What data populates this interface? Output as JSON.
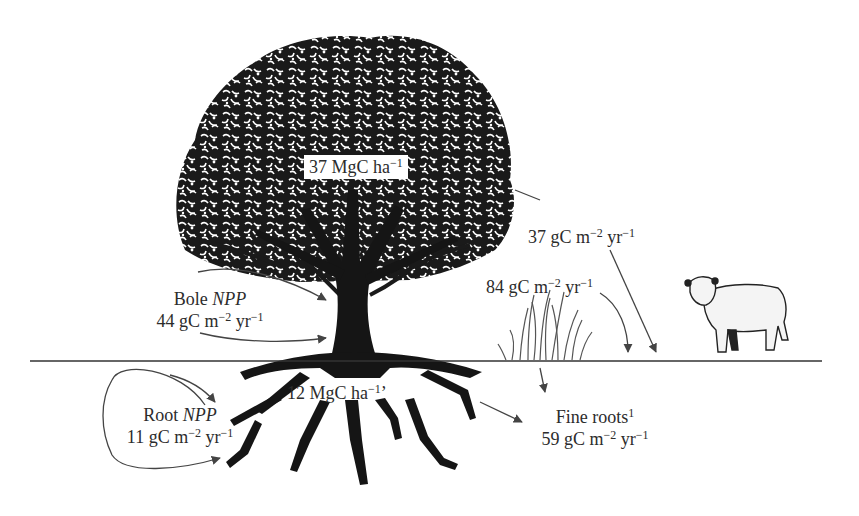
{
  "diagram": {
    "type": "carbon-flux-illustration",
    "colors": {
      "ink": "#1a1a1a",
      "text": "#2c2c2c",
      "arrow": "#555555",
      "background": "#ffffff"
    },
    "labels": {
      "canopy_stock": {
        "value": "37 MgC ha",
        "exp": "−1"
      },
      "litterfall": {
        "value": "37 gC m",
        "exp1": "−2",
        "unit2": " yr",
        "exp2": "−1"
      },
      "grass_flux": {
        "value": "84 gC m",
        "exp1": "−2",
        "unit2": " yr",
        "exp2": "−1"
      },
      "bole_npp": {
        "title": "Bole ",
        "title_italic": "NPP",
        "value": "44 gC m",
        "exp1": "−2",
        "unit2": " yr",
        "exp2": "−1"
      },
      "root_stock": {
        "value": "12 MgC ha",
        "exp": "−1",
        "mark": "’"
      },
      "root_npp": {
        "title": "Root ",
        "title_italic": "NPP",
        "value": "11 gC m",
        "exp1": "−2",
        "unit2": " yr",
        "exp2": "−1"
      },
      "fine_roots": {
        "title": "Fine roots",
        "title_sup": "1",
        "value": "59 gC m",
        "exp1": "−2",
        "unit2": " yr",
        "exp2": "−1"
      }
    },
    "elements": [
      "tree-canopy",
      "tree-trunk",
      "tree-roots",
      "ground-line",
      "grass-tuft",
      "cow"
    ]
  }
}
